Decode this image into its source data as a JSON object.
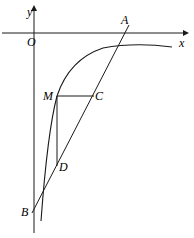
{
  "figure": {
    "kind": "geometry-diagram",
    "background_color": "#ffffff",
    "stroke_color": "#1a1a1a",
    "width": 194,
    "height": 238
  },
  "axes": {
    "origin_label": "O",
    "x_axis_label": "x",
    "y_axis_label": "y",
    "x_axis": {
      "y": 33,
      "x_start": 2,
      "x_end": 186,
      "arrow": "right"
    },
    "y_axis": {
      "x": 34,
      "y_start": 8,
      "y_end": 233,
      "arrow": "up"
    }
  },
  "points": [
    {
      "name": "A",
      "label": "A",
      "x": 127,
      "y": 28,
      "label_x": 121,
      "label_y": 14
    },
    {
      "name": "B",
      "label": "B",
      "x": 34,
      "y": 209,
      "label_x": 21,
      "label_y": 208
    },
    {
      "name": "C",
      "label": "C",
      "x": 93,
      "y": 96,
      "label_x": 95,
      "label_y": 91
    },
    {
      "name": "D",
      "label": "D",
      "x": 57,
      "y": 165,
      "label_x": 59,
      "label_y": 162
    },
    {
      "name": "M",
      "label": "M",
      "x": 57,
      "y": 96,
      "label_x": 44,
      "label_y": 91
    }
  ],
  "segments": [
    {
      "name": "line-AB",
      "from": "B",
      "to": "A",
      "x1": 32,
      "y1": 213,
      "x2": 129,
      "y2": 25
    },
    {
      "name": "segment-MC",
      "from": "M",
      "to": "C",
      "x1": 57,
      "y1": 96,
      "x2": 94,
      "y2": 96
    },
    {
      "name": "segment-MD",
      "from": "M",
      "to": "D",
      "x1": 57,
      "y1": 96,
      "x2": 57,
      "y2": 166
    }
  ],
  "curve": {
    "name": "logarithmic-curve",
    "description": "increasing concave-down curve rising from lower-left to upper-right",
    "path": "M 41,221 C 44,180 48,130 57,96 C 66,69 82,55 103,48 C 124,44 150,44 172,47"
  }
}
